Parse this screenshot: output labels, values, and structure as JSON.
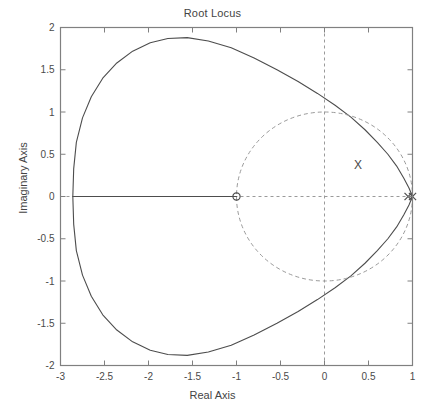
{
  "figure": {
    "title": "Root Locus",
    "background": "#ffffff",
    "axes_color": "#808080",
    "curve_color": "#4d4d4d",
    "grid_color": "#9a9a9a"
  },
  "axes": {
    "xlabel": "Real Axis",
    "ylabel": "Imaginary Axis",
    "xticks": [
      "-3",
      "-2.5",
      "-2",
      "-1.5",
      "-1",
      "-0.5",
      "0",
      "0.5",
      "1"
    ],
    "xtick_values": [
      -3,
      -2.5,
      -2,
      -1.5,
      -1,
      -0.5,
      0,
      0.5,
      1
    ],
    "yticks": [
      "2",
      "1.5",
      "1",
      "0.5",
      "0",
      "-0.5",
      "-1",
      "-1.5",
      "-2"
    ],
    "ytick_values": [
      2,
      1.5,
      1,
      0.5,
      0,
      -0.5,
      -1,
      -1.5,
      -2
    ]
  },
  "annotations": [
    {
      "name": "x-marker-label",
      "text": "X",
      "x": 0.38,
      "y": 0.37
    }
  ],
  "chart_data": {
    "type": "line",
    "title": "Root Locus",
    "xlabel": "Real Axis",
    "ylabel": "Imaginary Axis",
    "xlim": [
      -3,
      1
    ],
    "ylim": [
      -2,
      2
    ],
    "grid": false,
    "legend": null,
    "series": [
      {
        "name": "root-locus-branch",
        "style": "solid",
        "description": "Large closed oval locus passing through leftmost real-axis point -2.86 and converging to poles near +1; peak imaginary magnitude about 1.90 near real -0.95",
        "points": [
          [
            1.0,
            0.0
          ],
          [
            0.96,
            0.1
          ],
          [
            0.9,
            0.22
          ],
          [
            0.82,
            0.36
          ],
          [
            0.72,
            0.5
          ],
          [
            0.6,
            0.64
          ],
          [
            0.46,
            0.79
          ],
          [
            0.3,
            0.94
          ],
          [
            0.12,
            1.08
          ],
          [
            -0.08,
            1.22
          ],
          [
            -0.3,
            1.36
          ],
          [
            -0.54,
            1.5
          ],
          [
            -0.8,
            1.64
          ],
          [
            -1.06,
            1.76
          ],
          [
            -1.32,
            1.84
          ],
          [
            -1.56,
            1.88
          ],
          [
            -1.78,
            1.87
          ],
          [
            -1.98,
            1.82
          ],
          [
            -2.18,
            1.72
          ],
          [
            -2.36,
            1.58
          ],
          [
            -2.52,
            1.4
          ],
          [
            -2.65,
            1.18
          ],
          [
            -2.75,
            0.93
          ],
          [
            -2.82,
            0.64
          ],
          [
            -2.85,
            0.33
          ],
          [
            -2.86,
            0.0
          ],
          [
            -2.85,
            -0.33
          ],
          [
            -2.82,
            -0.64
          ],
          [
            -2.75,
            -0.93
          ],
          [
            -2.65,
            -1.18
          ],
          [
            -2.52,
            -1.4
          ],
          [
            -2.36,
            -1.58
          ],
          [
            -2.18,
            -1.72
          ],
          [
            -1.98,
            -1.82
          ],
          [
            -1.78,
            -1.87
          ],
          [
            -1.56,
            -1.88
          ],
          [
            -1.32,
            -1.84
          ],
          [
            -1.06,
            -1.76
          ],
          [
            -0.8,
            -1.64
          ],
          [
            -0.54,
            -1.5
          ],
          [
            -0.3,
            -1.36
          ],
          [
            -0.08,
            -1.22
          ],
          [
            0.12,
            -1.08
          ],
          [
            0.3,
            -0.94
          ],
          [
            0.46,
            -0.79
          ],
          [
            0.6,
            -0.64
          ],
          [
            0.72,
            -0.5
          ],
          [
            0.82,
            -0.36
          ],
          [
            0.9,
            -0.22
          ],
          [
            0.96,
            -0.1
          ],
          [
            1.0,
            0.0
          ]
        ]
      },
      {
        "name": "real-axis-branch",
        "style": "solid",
        "description": "Solid real-axis locus segment from -2.86 to the zero at -1",
        "points": [
          [
            -2.86,
            0.0
          ],
          [
            -1.0,
            0.0
          ]
        ]
      },
      {
        "name": "unit-circle",
        "style": "dashed",
        "description": "Dashed unit circle centered at origin, radius 1",
        "center": [
          0,
          0
        ],
        "radius": 1
      }
    ],
    "markers": {
      "zeros": [
        {
          "x": -1.0,
          "y": 0.0,
          "symbol": "o"
        }
      ],
      "poles": [
        {
          "x": 0.95,
          "y": 0.0,
          "symbol": "x"
        },
        {
          "x": 1.0,
          "y": 0.0,
          "symbol": "x"
        }
      ]
    },
    "reference_lines": [
      {
        "name": "vertical-zero-line",
        "orientation": "vertical",
        "value": 0,
        "style": "dashed"
      },
      {
        "name": "horizontal-zero-line",
        "orientation": "horizontal",
        "value": 0,
        "style": "dashed"
      }
    ]
  }
}
